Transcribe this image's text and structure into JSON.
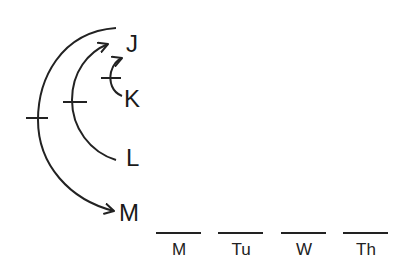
{
  "diagram": {
    "type": "seating/ordering logic diagram",
    "elements": [
      {
        "id": "J",
        "label": "J"
      },
      {
        "id": "K",
        "label": "K"
      },
      {
        "id": "L",
        "label": "L"
      },
      {
        "id": "M",
        "label": "M"
      }
    ],
    "arrows": [
      {
        "from": "K",
        "to": "J",
        "crossed": true,
        "note": "small arc K to J with tick mark"
      },
      {
        "from": "L",
        "to": "J",
        "crossed": true,
        "note": "arc L to J with tick mark"
      },
      {
        "from": "J",
        "to": "M",
        "crossed": true,
        "note": "outer arc J to M with tick mark"
      }
    ],
    "slots": [
      {
        "label": "M"
      },
      {
        "label": "Tu"
      },
      {
        "label": "W"
      },
      {
        "label": "Th"
      }
    ],
    "stroke_color": "#222222"
  }
}
